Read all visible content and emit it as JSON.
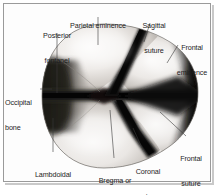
{
  "figure": {
    "caption_partial": "",
    "frame_color": "#9a9a9a",
    "background_color": "#ffffff",
    "bone_light": "#f2f0ee",
    "bone_mid": "#cfcbc7",
    "bone_shadow": "#6f6b67",
    "suture_dark": "#111111",
    "leader_color": "#3a3a3a",
    "text_color": "#1d1d1d"
  },
  "labels": [
    {
      "id": "posterior-fontanel",
      "line1": "Posterior",
      "line2": "fontanel",
      "x": 30,
      "y": 16,
      "w": 54,
      "align": "c"
    },
    {
      "id": "parietal-eminence",
      "line1": "Parietal eminence",
      "line2": "",
      "x": 60,
      "y": 6,
      "w": 76,
      "align": "c"
    },
    {
      "id": "sagittal-suture",
      "line1": "Sagittal",
      "line2": "suture",
      "x": 136,
      "y": 6,
      "w": 36,
      "align": "c"
    },
    {
      "id": "frontal-eminence",
      "line1": "Frontal",
      "line2": "eminence",
      "x": 170,
      "y": 28,
      "w": 44,
      "align": "c"
    },
    {
      "id": "occipital-bone",
      "line1": "Occipital",
      "line2": "bone",
      "x": 5,
      "y": 83,
      "w": 42,
      "align": "l"
    },
    {
      "id": "lambdoidal-suture",
      "line1": "Lambdoidal",
      "line2": "suture",
      "x": 26,
      "y": 155,
      "w": 54,
      "align": "c"
    },
    {
      "id": "bregma-anterior-fontanel",
      "line1": "Bregma or",
      "line2": "anterior fontanel",
      "x": 82,
      "y": 161,
      "w": 66,
      "align": "c"
    },
    {
      "id": "coronal-suture",
      "line1": "Coronal",
      "line2": "suture",
      "x": 129,
      "y": 152,
      "w": 38,
      "align": "c"
    },
    {
      "id": "frontal-suture",
      "line1": "Frontal",
      "line2": "suture",
      "x": 172,
      "y": 139,
      "w": 38,
      "align": "c"
    }
  ],
  "structures": [
    {
      "id": "right-parietal-bone",
      "name": "Right parietal bone"
    },
    {
      "id": "left-parietal-bone",
      "name": "Left parietal bone"
    },
    {
      "id": "right-frontal-bone",
      "name": "Right frontal bone"
    },
    {
      "id": "left-frontal-bone",
      "name": "Left frontal bone"
    },
    {
      "id": "occipital-bone",
      "name": "Occipital bone"
    }
  ]
}
